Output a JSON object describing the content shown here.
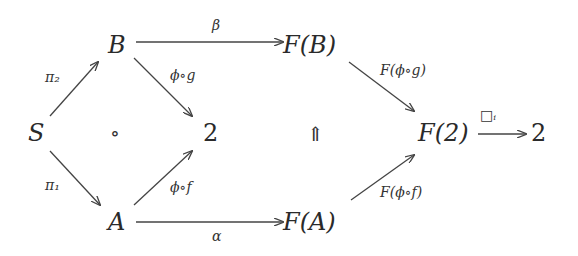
{
  "nodes": {
    "S": "S",
    "B": "B",
    "A": "A",
    "two_mid": "2",
    "FB": "F(B)",
    "FA": "F(A)",
    "F2": "F(2)",
    "two_right": "2"
  },
  "symbols": {
    "compose": "∘",
    "double_arrow": "⇑"
  },
  "edges": {
    "pi2": "π₂",
    "pi1": "π₁",
    "phi_g": "ϕ∘g",
    "phi_f": "ϕ∘f",
    "beta": "β",
    "alpha": "α",
    "F_phi_g": "F(ϕ∘g)",
    "F_phi_f": "F(ϕ∘f)",
    "box_i": "□ᵢ"
  }
}
